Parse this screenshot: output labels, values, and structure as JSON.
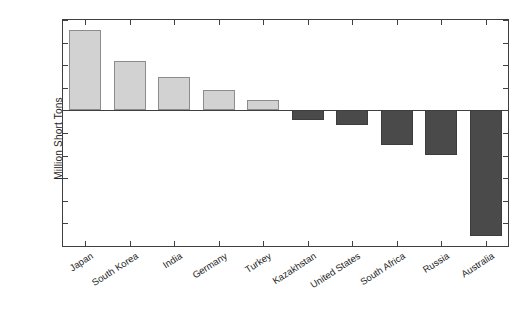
{
  "chart_data": {
    "type": "bar",
    "title": "",
    "xlabel": "",
    "ylabel": "Million Short Tons",
    "ylim": [
      -300,
      200
    ],
    "ytick_values": [
      200,
      150,
      100,
      50,
      0,
      -50,
      -100,
      -150,
      -200,
      -250,
      -300
    ],
    "ytick_labels": [
      "200",
      "150",
      "100",
      "50",
      "0",
      "-50",
      "-100",
      "-150",
      "-200",
      "-250",
      "-300"
    ],
    "grid": false,
    "legend": null,
    "categories": [
      "Japan",
      "South Korea",
      "India",
      "Germany",
      "Turkey",
      "Kazakhstan",
      "United States",
      "South Africa",
      "Russia",
      "Australia"
    ],
    "values": [
      178,
      110,
      75,
      46,
      24,
      -22,
      -33,
      -77,
      -99,
      -279
    ],
    "colors": {
      "positive_bar": "#d2d2d2",
      "positive_bar_edge": "#8c8c8c",
      "negative_bar": "#4a4a4a",
      "negative_bar_edge": "#3d3d3d",
      "axis": "#3f3f3f",
      "text": "#262626",
      "background": "#ffffff"
    }
  }
}
